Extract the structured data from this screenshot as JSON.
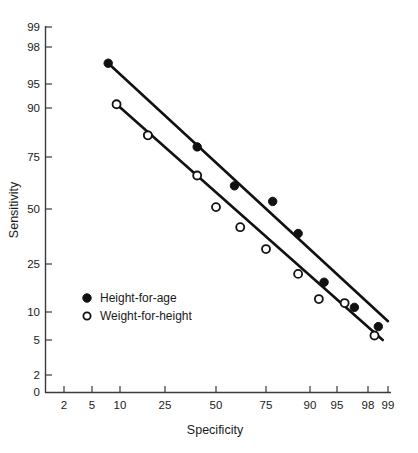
{
  "chart_data": {
    "type": "scatter",
    "title": "",
    "xlabel": "Specificity",
    "ylabel": "Sensitivity",
    "xticks": [
      2,
      5,
      10,
      25,
      50,
      75,
      90,
      95,
      98,
      99
    ],
    "xtick_labels": [
      "2",
      "5",
      "10",
      "25",
      "50",
      "75",
      "90",
      "95",
      "98",
      "99"
    ],
    "yticks": [
      0,
      2,
      5,
      10,
      25,
      50,
      75,
      90,
      95,
      98,
      99
    ],
    "ytick_labels": [
      "0",
      "2",
      "5",
      "10",
      "25",
      "50",
      "75",
      "90",
      "95",
      "98",
      "99"
    ],
    "xlim": [
      1,
      99.5
    ],
    "ylim": [
      0,
      99.5
    ],
    "scale": "logit",
    "grid": false,
    "legend_position": "inside-lower-left",
    "series": [
      {
        "name": "Height-for-age",
        "marker": "filled-circle",
        "color": "#111111",
        "points": [
          {
            "x": 7.5,
            "y": 97
          },
          {
            "x": 18,
            "y": 83
          },
          {
            "x": 40,
            "y": 79
          },
          {
            "x": 60,
            "y": 62
          },
          {
            "x": 78,
            "y": 54
          },
          {
            "x": 87,
            "y": 38
          },
          {
            "x": 93,
            "y": 18
          },
          {
            "x": 97,
            "y": 11
          },
          {
            "x": 98.6,
            "y": 7
          }
        ],
        "fit_line": {
          "x1": 7.5,
          "y1": 97,
          "x2": 99,
          "y2": 8
        }
      },
      {
        "name": "Weight-for-height",
        "marker": "open-circle",
        "color": "#111111",
        "points": [
          {
            "x": 9.2,
            "y": 91
          },
          {
            "x": 18,
            "y": 83
          },
          {
            "x": 40,
            "y": 67
          },
          {
            "x": 50,
            "y": 51
          },
          {
            "x": 63,
            "y": 41
          },
          {
            "x": 75,
            "y": 31
          },
          {
            "x": 87,
            "y": 21
          },
          {
            "x": 92,
            "y": 13
          },
          {
            "x": 96,
            "y": 12
          },
          {
            "x": 98.4,
            "y": 5.6
          }
        ],
        "fit_line": {
          "x1": 9.2,
          "y1": 91,
          "x2": 98.8,
          "y2": 5
        }
      }
    ],
    "legend": [
      {
        "label": "Height-for-age",
        "marker": "filled-circle"
      },
      {
        "label": "Weight-for-height",
        "marker": "open-circle"
      }
    ]
  }
}
